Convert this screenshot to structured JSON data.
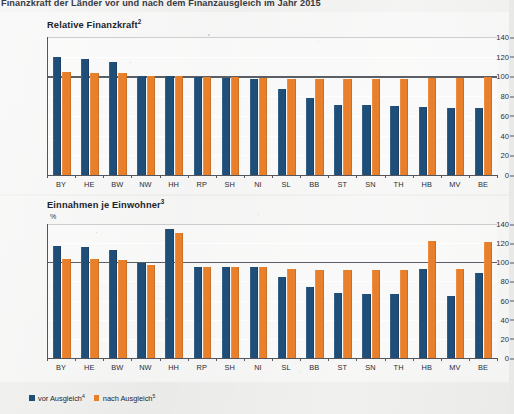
{
  "document": {
    "title": "Finanzkraft der Länder vor und nach dem Finanzausgleich im Jahr 2015"
  },
  "legend": {
    "items": [
      {
        "label": "vor Ausgleich",
        "sup": "4",
        "color": "#1f4e79",
        "name": "vor-ausgleich"
      },
      {
        "label": "nach Ausgleich",
        "sup": "5",
        "color": "#e8802b",
        "name": "nach-ausgleich"
      }
    ]
  },
  "colors": {
    "before": "#1f4e79",
    "after": "#e8802b",
    "background": "#e9e9e7",
    "axis": "#54565d",
    "reference_line": "#5c5e65"
  },
  "chart_data": [
    {
      "type": "bar",
      "name": "relative-finanzkraft",
      "title": "Relative Finanzkraft",
      "title_sup": "2",
      "unit": "",
      "xlabel": "",
      "ylabel": "",
      "ylim": [
        0,
        140
      ],
      "yticks": [
        0,
        20,
        40,
        60,
        80,
        100,
        120,
        140
      ],
      "grid": true,
      "reference_line": 100,
      "legend_position": "bottom",
      "categories": [
        "BY",
        "HE",
        "BW",
        "NW",
        "HH",
        "RP",
        "SH",
        "NI",
        "SL",
        "BB",
        "ST",
        "SN",
        "TH",
        "HB",
        "MV",
        "BE"
      ],
      "series": [
        {
          "name": "vor Ausgleich",
          "color": "#1f4e79",
          "values": [
            120,
            118,
            115,
            100,
            100,
            99,
            98,
            97,
            87,
            78,
            71,
            71,
            70,
            69,
            68,
            68
          ]
        },
        {
          "name": "nach Ausgleich",
          "color": "#e8802b",
          "values": [
            105,
            104,
            103,
            100,
            100,
            99,
            99,
            98,
            97,
            97,
            97,
            97,
            97,
            98,
            98,
            99
          ]
        }
      ]
    },
    {
      "type": "bar",
      "name": "einnahmen-je-einwohner",
      "title": "Einnahmen je Einwohner",
      "title_sup": "3",
      "unit": "%",
      "xlabel": "",
      "ylabel": "",
      "ylim": [
        0,
        140
      ],
      "yticks": [
        0,
        20,
        40,
        60,
        80,
        100,
        120,
        140
      ],
      "grid": true,
      "reference_line": 100,
      "legend_position": "bottom",
      "categories": [
        "BY",
        "HE",
        "BW",
        "NW",
        "HH",
        "RP",
        "SH",
        "NI",
        "SL",
        "BB",
        "ST",
        "SN",
        "TH",
        "HB",
        "MV",
        "BE"
      ],
      "series": [
        {
          "name": "vor Ausgleich",
          "color": "#1f4e79",
          "values": [
            117,
            116,
            113,
            99,
            135,
            95,
            95,
            95,
            85,
            74,
            68,
            67,
            67,
            93,
            65,
            89
          ]
        },
        {
          "name": "nach Ausgleich",
          "color": "#e8802b",
          "values": [
            103,
            103,
            102,
            97,
            131,
            95,
            95,
            95,
            93,
            92,
            92,
            92,
            92,
            122,
            93,
            121
          ]
        }
      ]
    }
  ]
}
